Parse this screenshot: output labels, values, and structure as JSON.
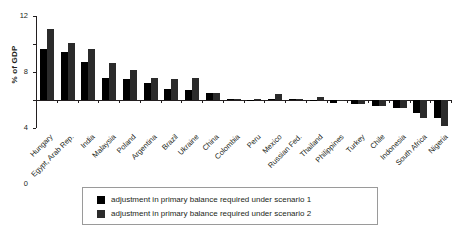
{
  "chart_data": {
    "type": "bar",
    "title": "",
    "xlabel": "",
    "ylabel": "% of GDP",
    "ylim": [
      -4,
      12
    ],
    "yticks": [
      12,
      8,
      4,
      0,
      -4
    ],
    "grid": false,
    "legend_position": "bottom",
    "categories": [
      "Hungary",
      "Egypt, Arab Rep.",
      "India",
      "Malaysia",
      "Poland",
      "Argentina",
      "Brazil",
      "Ukraine",
      "China",
      "Colombia",
      "Peru",
      "Mexico",
      "Russian Fed.",
      "Thailand",
      "Philippines",
      "Turkey",
      "Chile",
      "Indonesia",
      "South Africa",
      "Nigeria"
    ],
    "series": [
      {
        "name": "adjustment in primary balance required under scenario 1",
        "color": "#000000",
        "values": [
          7.3,
          6.8,
          5.5,
          3.2,
          3.0,
          2.5,
          1.6,
          1.4,
          1.0,
          0.2,
          -0.1,
          0.1,
          0.1,
          -0.2,
          -0.4,
          -0.6,
          -0.9,
          -1.2,
          -1.8,
          -2.6
        ]
      },
      {
        "name": "adjustment in primary balance required under scenario 2",
        "color": "#2b2b2b",
        "values": [
          10.1,
          8.1,
          7.3,
          5.3,
          4.3,
          3.2,
          3.0,
          3.2,
          1.0,
          0.2,
          0.1,
          0.8,
          0.1,
          0.4,
          -0.2,
          -0.5,
          -0.8,
          -1.2,
          -2.6,
          -3.7
        ]
      }
    ]
  },
  "legend": {
    "items": [
      {
        "label": "adjustment in primary balance required under scenario 1",
        "color": "#000000"
      },
      {
        "label": "adjustment in primary balance required under scenario 2",
        "color": "#2b2b2b"
      }
    ]
  }
}
